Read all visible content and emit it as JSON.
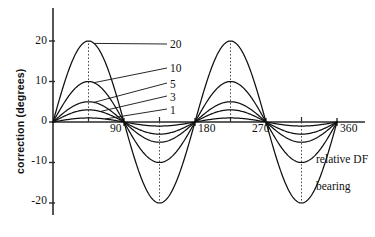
{
  "chart_data": {
    "type": "line",
    "title": "",
    "subtitle": "",
    "xlabel": "relative DF bearing",
    "ylabel": "correction (degrees)",
    "xlim": [
      0,
      375
    ],
    "ylim": [
      -24,
      24
    ],
    "grid": false,
    "legend_position": "inline-leader-labels",
    "x_major_ticks": [
      90,
      180,
      270,
      360
    ],
    "x_major_tick_labels": [
      "90",
      "180",
      "270",
      "360"
    ],
    "x_minor_ticks": [
      45,
      135,
      225,
      315
    ],
    "y_ticks": [
      20,
      10,
      0,
      -10,
      -20
    ],
    "y_tick_labels": [
      "20",
      "10",
      "0",
      "-10",
      "-20"
    ],
    "curve_form": "A * sin(2 * theta)",
    "x_values_deg": [
      0,
      15,
      30,
      45,
      60,
      75,
      90,
      105,
      120,
      135,
      150,
      165,
      180,
      195,
      210,
      225,
      240,
      255,
      270,
      285,
      300,
      315,
      330,
      345,
      360
    ],
    "series": [
      {
        "name": "20",
        "amplitude": 20,
        "values": [
          0,
          10,
          17.32,
          20,
          17.32,
          10,
          0,
          -10,
          -17.32,
          -20,
          -17.32,
          -10,
          0,
          10,
          17.32,
          20,
          17.32,
          10,
          0,
          -10,
          -17.32,
          -20,
          -17.32,
          -10,
          0
        ]
      },
      {
        "name": "10",
        "amplitude": 10,
        "values": [
          0,
          5,
          8.66,
          10,
          8.66,
          5,
          0,
          -5,
          -8.66,
          -10,
          -8.66,
          -5,
          0,
          5,
          8.66,
          10,
          8.66,
          5,
          0,
          -5,
          -8.66,
          -10,
          -8.66,
          -5,
          0
        ]
      },
      {
        "name": "5",
        "amplitude": 5,
        "values": [
          0,
          2.5,
          4.33,
          5,
          4.33,
          2.5,
          0,
          -2.5,
          -4.33,
          -5,
          -4.33,
          -2.5,
          0,
          2.5,
          4.33,
          5,
          4.33,
          2.5,
          0,
          -2.5,
          -4.33,
          -5,
          -4.33,
          -2.5,
          0
        ]
      },
      {
        "name": "3",
        "amplitude": 3,
        "values": [
          0,
          1.5,
          2.6,
          3,
          2.6,
          1.5,
          0,
          -1.5,
          -2.6,
          -3,
          -2.6,
          -1.5,
          0,
          1.5,
          2.6,
          3,
          2.6,
          1.5,
          0,
          -1.5,
          -2.6,
          -3,
          -2.6,
          -1.5,
          0
        ]
      },
      {
        "name": "1",
        "amplitude": 1,
        "values": [
          0,
          0.5,
          0.87,
          1,
          0.87,
          0.5,
          0,
          -0.5,
          -0.87,
          -1,
          -0.87,
          -0.5,
          0,
          0.5,
          0.87,
          1,
          0.87,
          0.5,
          0,
          -0.5,
          -0.87,
          -1,
          -0.87,
          -0.5,
          0
        ]
      }
    ],
    "annotations": [
      {
        "label": "20",
        "points_to_deg": 45,
        "points_to_value": 20
      },
      {
        "label": "10",
        "points_to_deg": 45,
        "points_to_value": 10
      },
      {
        "label": "5",
        "points_to_deg": 45,
        "points_to_value": 5
      },
      {
        "label": "3",
        "points_to_deg": 45,
        "points_to_value": 3
      },
      {
        "label": "1",
        "points_to_deg": 45,
        "points_to_value": 1
      }
    ],
    "dotted_verticals_deg": [
      45,
      135,
      225,
      315
    ],
    "colors": {
      "curve": "#101010",
      "axis": "#2a2a2a",
      "dotted": "#3a3a3a",
      "background": "#ffffff"
    }
  },
  "axes": {
    "y_title": "correction (degrees)",
    "x_title_line1": "relative DF",
    "x_title_line2": "bearing"
  },
  "y_tick_labels": {
    "t20": "20",
    "t10": "10",
    "t0": "0",
    "tm10": "-10",
    "tm20": "-20"
  },
  "x_tick_labels": {
    "t90": "90",
    "t180": "180",
    "t270": "270",
    "t360": "360"
  },
  "legend": {
    "l20": "20",
    "l10": "10",
    "l5": "5",
    "l3": "3",
    "l1": "1"
  }
}
